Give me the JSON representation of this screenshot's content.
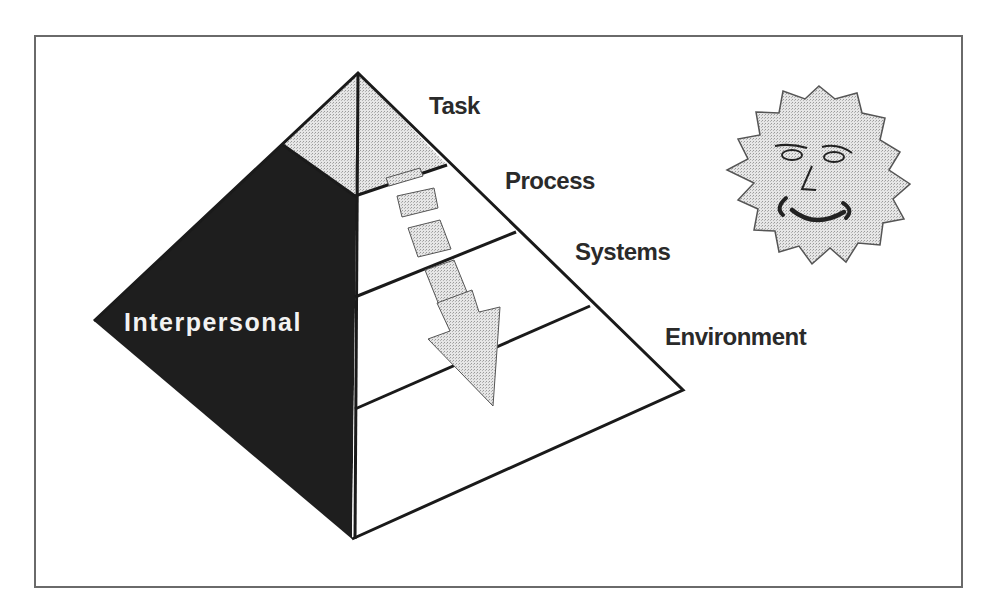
{
  "figure": {
    "colors": {
      "frame": "#6a6a6a",
      "outline": "#1a1a1a",
      "dark_face": "#1e1e1e",
      "stipple": "#d8d8d8",
      "text": "#2a2a2a",
      "text_on_dark": "#f2f2f2"
    }
  },
  "pyramid": {
    "levels": [
      {
        "label": "Task"
      },
      {
        "label": "Process"
      },
      {
        "label": "Systems"
      },
      {
        "label": "Environment"
      }
    ],
    "side_label": "Interpersonal",
    "flow_arrow": "down-arrow-through-levels"
  },
  "decoration": {
    "icon": "smiling-sun-face"
  }
}
